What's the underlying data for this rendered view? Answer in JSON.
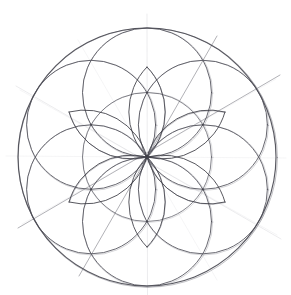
{
  "artwork": {
    "title": "Hand-drawn geometric rosette",
    "subtitle": "Flower of Life / six-petal rose construction",
    "medium": "pencil on paper",
    "background_color": "#ffffff",
    "ink_color": "#4a4a52",
    "faint_guide_color": "#c6c6cc",
    "canvas": {
      "width": 291,
      "height": 295
    }
  },
  "chart_data": {
    "type": "scatter",
    "xlabel": "",
    "ylabel": "",
    "xlim": [
      0,
      291
    ],
    "ylim": [
      0,
      295
    ],
    "grid": false,
    "legend": "none",
    "center": {
      "x": 147,
      "y": 157
    },
    "outer_circle": {
      "cx": 147,
      "cy": 157,
      "r": 129
    },
    "mid_circle": {
      "cx": 147,
      "cy": 157,
      "r": 64.5
    },
    "petal_circle_radius": 64.5,
    "petal_count": 6,
    "petal_centers": [
      {
        "label": "N",
        "angle_deg": -90,
        "x": 147.0,
        "y": 92.5
      },
      {
        "label": "NE",
        "angle_deg": -30,
        "x": 202.9,
        "y": 124.8
      },
      {
        "label": "SE",
        "angle_deg": 30,
        "x": 202.9,
        "y": 189.3
      },
      {
        "label": "S",
        "angle_deg": 90,
        "x": 147.0,
        "y": 221.5
      },
      {
        "label": "SW",
        "angle_deg": 150,
        "x": 91.1,
        "y": 189.3
      },
      {
        "label": "NW",
        "angle_deg": 210,
        "x": 91.1,
        "y": 124.8
      }
    ],
    "guide_lines": [
      {
        "label": "vertical-axis",
        "angle_deg": 90,
        "x1": 147.0,
        "y1": 16,
        "x2": 147.0,
        "y2": 295
      },
      {
        "label": "horizontal-axis",
        "angle_deg": 0,
        "x1": 8,
        "y1": 157,
        "x2": 285,
        "y2": 157
      },
      {
        "label": "diagonal-30",
        "angle_deg": 30,
        "x1": 20,
        "y1": 226,
        "x2": 278,
        "y2": 77
      },
      {
        "label": "diagonal-150",
        "angle_deg": 150,
        "x1": 20,
        "y1": 88,
        "x2": 278,
        "y2": 237
      },
      {
        "label": "diagonal-60",
        "angle_deg": 60,
        "x1": 80,
        "y1": 272,
        "x2": 215,
        "y2": 38
      },
      {
        "label": "diagonal-120",
        "angle_deg": 120,
        "x1": 80,
        "y1": 42,
        "x2": 215,
        "y2": 276
      }
    ],
    "intersection_nodes": [
      {
        "x": 147.0,
        "y": 28.0,
        "label": "top-vertex"
      },
      {
        "x": 147.0,
        "y": 286.0,
        "label": "bottom-vertex"
      },
      {
        "x": 18.0,
        "y": 157.0,
        "label": "left-vertex"
      },
      {
        "x": 276.0,
        "y": 157.0,
        "label": "right-vertex"
      },
      {
        "x": 147.0,
        "y": 67.0,
        "label": "upper-petal-tip"
      },
      {
        "x": 147.0,
        "y": 247.0,
        "label": "lower-petal-tip"
      },
      {
        "x": 91.1,
        "y": 124.8,
        "label": "nw-circle-center"
      },
      {
        "x": 202.9,
        "y": 124.8,
        "label": "ne-circle-center"
      },
      {
        "x": 91.1,
        "y": 189.3,
        "label": "sw-circle-center"
      },
      {
        "x": 202.9,
        "y": 189.3,
        "label": "se-circle-center"
      },
      {
        "x": 147.0,
        "y": 92.5,
        "label": "n-circle-center"
      },
      {
        "x": 147.0,
        "y": 221.5,
        "label": "s-circle-center"
      }
    ]
  }
}
